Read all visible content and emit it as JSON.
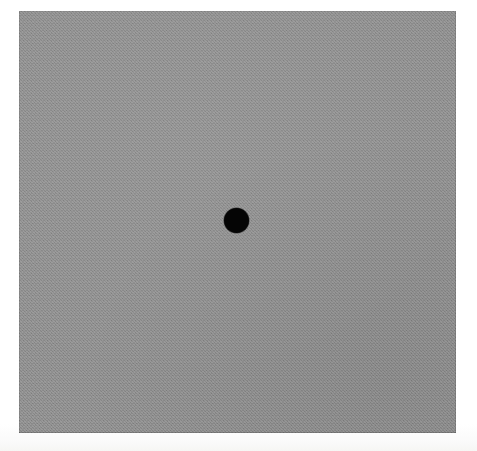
{
  "stimulus": {
    "title": "Uniform gray field with central fixation dot",
    "canvas": {
      "width_px": 477,
      "height_px": 451,
      "background_color": "#fdfdfd"
    },
    "field": {
      "name": "gray-field",
      "shape": "rectangle",
      "fill_color": "#8e8e8e",
      "texture": "fine halftone dither grain",
      "left_px": 19,
      "top_px": 11,
      "width_px": 437,
      "height_px": 422
    },
    "fixation_dot": {
      "name": "fixation-dot",
      "shape": "circle",
      "fill_color": "#050505",
      "center_x_px": 236,
      "center_y_px": 220,
      "diameter_px": 25
    },
    "margin": {
      "name": "paper-margin",
      "color": "#ffffff",
      "left_px": 19,
      "top_px": 11,
      "right_px": 21,
      "bottom_px": 18
    }
  }
}
